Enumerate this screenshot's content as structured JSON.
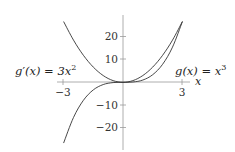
{
  "chart_data": {
    "type": "line",
    "title": "",
    "xlabel": "x",
    "ylabel": "",
    "xlim": [
      -3,
      3
    ],
    "ylim": [
      -27,
      27
    ],
    "grid": false,
    "x_ticks": [
      -3,
      3
    ],
    "x_tick_labels": [
      "−3",
      "3"
    ],
    "y_ticks": [
      20,
      10,
      -10,
      -20
    ],
    "y_tick_labels": [
      "20",
      "10",
      "−10",
      "−20"
    ],
    "series": [
      {
        "name": "g'(x) = 3x^2",
        "label_parts": {
          "fn": "g",
          "prime": "′",
          "arg": "(x) = 3x",
          "exp": "2"
        },
        "x": [
          -3,
          -2.5,
          -2,
          -1.5,
          -1,
          -0.5,
          0,
          0.5,
          1,
          1.5,
          2,
          2.5,
          3
        ],
        "values": [
          27,
          18.75,
          12,
          6.75,
          3,
          0.75,
          0,
          0.75,
          3,
          6.75,
          12,
          18.75,
          27
        ]
      },
      {
        "name": "g(x) = x^3",
        "label_parts": {
          "fn": "g",
          "arg": "(x) = x",
          "exp": "3"
        },
        "x": [
          -3,
          -2.5,
          -2,
          -1.5,
          -1,
          -0.5,
          0,
          0.5,
          1,
          1.5,
          2,
          2.5,
          3
        ],
        "values": [
          -27,
          -15.625,
          -8,
          -3.375,
          -1,
          -0.125,
          0,
          0.125,
          1,
          3.375,
          8,
          15.625,
          27
        ]
      }
    ],
    "annotations": [
      {
        "text": "g'(x) = 3x^2",
        "position": "left of y-axis, above x-axis"
      },
      {
        "text": "g(x) = x^3",
        "position": "right of y-axis, above x-axis"
      }
    ]
  },
  "labels": {
    "left_fn": "g",
    "left_prime": "′",
    "left_rest": "(x) = 3x",
    "left_exp": "2",
    "right_fn": "g",
    "right_rest": "(x) = x",
    "right_exp": "3",
    "x_axis": "x"
  },
  "ticks": {
    "x_neg": "−3",
    "x_pos": "3",
    "y20": "20",
    "y10": "10",
    "ym10": "−10",
    "ym20": "−20"
  },
  "colors": {
    "axis": "#999999",
    "curve": "#333333"
  }
}
